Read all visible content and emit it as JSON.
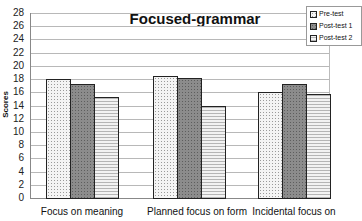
{
  "chart_data": {
    "type": "bar",
    "title": "Focused-grammar",
    "xlabel": "",
    "ylabel": "Scores",
    "ylim": [
      0,
      28
    ],
    "yticks": [
      0,
      2,
      4,
      6,
      8,
      10,
      12,
      14,
      16,
      18,
      20,
      22,
      24,
      26,
      28
    ],
    "grid": true,
    "legend_position": "top-right",
    "categories": [
      "Focus on meaning",
      "Planned focus on form",
      "Incidental focus on"
    ],
    "series": [
      {
        "name": "Pre-test",
        "values": [
          18.0,
          18.4,
          16.0
        ]
      },
      {
        "name": "Post-test 1",
        "values": [
          17.3,
          18.1,
          17.3
        ]
      },
      {
        "name": "Post-test 2",
        "values": [
          15.3,
          14.0,
          15.8
        ]
      }
    ]
  }
}
